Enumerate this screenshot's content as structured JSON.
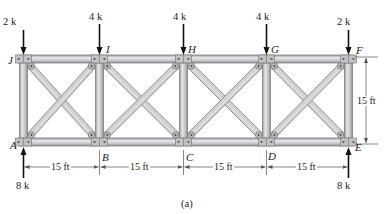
{
  "figure": {
    "caption": "(a)",
    "nodes": {
      "top": [
        "J",
        "I",
        "H",
        "G",
        "F"
      ],
      "bottom": [
        "A",
        "B",
        "C",
        "D",
        "E"
      ]
    },
    "loads": [
      {
        "label": "2 k",
        "node": "J",
        "direction": "down"
      },
      {
        "label": "4 k",
        "node": "I",
        "direction": "down"
      },
      {
        "label": "4 k",
        "node": "H",
        "direction": "down"
      },
      {
        "label": "4 k",
        "node": "G",
        "direction": "down"
      },
      {
        "label": "2 k",
        "node": "F",
        "direction": "down"
      }
    ],
    "reactions": [
      {
        "label": "8 k",
        "node": "A",
        "direction": "up"
      },
      {
        "label": "8 k",
        "node": "E",
        "direction": "up"
      }
    ],
    "dimensions": {
      "spans": [
        "15 ft",
        "15 ft",
        "15 ft",
        "15 ft"
      ],
      "height": "15 ft"
    },
    "colors": {
      "member_fill": "#c9cbcc",
      "member_edge": "#7d8082",
      "member_highlight": "#e6e7e8",
      "gusset": "#b4b6b8",
      "arrow": "#111111",
      "dim_line": "#555555"
    }
  }
}
